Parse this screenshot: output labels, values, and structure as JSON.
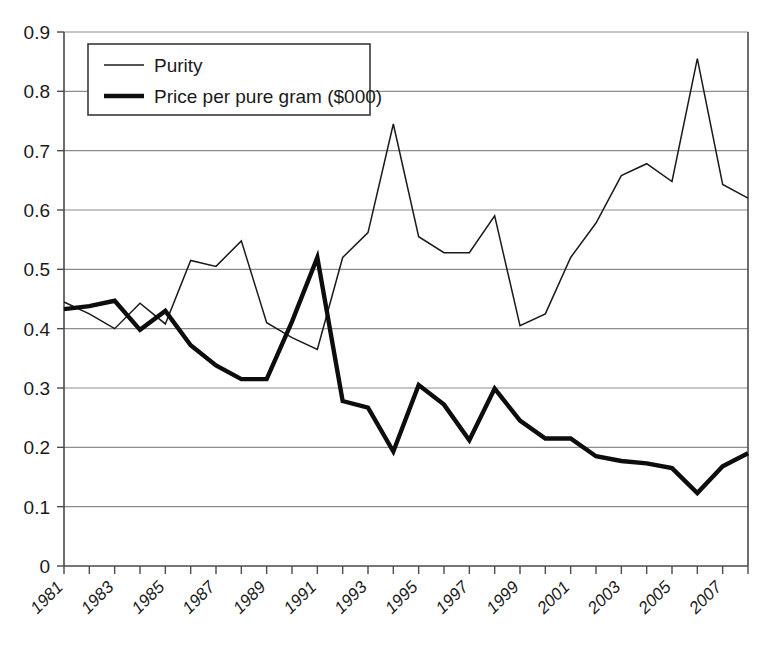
{
  "chart_data": {
    "type": "line",
    "title": "",
    "subtitle": "",
    "xlabel": "",
    "ylabel": "",
    "x": [
      1981,
      1982,
      1983,
      1984,
      1985,
      1986,
      1987,
      1988,
      1989,
      1990,
      1991,
      1992,
      1993,
      1994,
      1995,
      1996,
      1997,
      1998,
      1999,
      2000,
      2001,
      2002,
      2003,
      2004,
      2005,
      2006,
      2007,
      2008
    ],
    "xlim": [
      1981,
      2008
    ],
    "ylim": [
      0,
      0.9
    ],
    "ytick_labels": [
      "0.9",
      "0.8",
      "0.7",
      "0.6",
      "0.5",
      "0.4",
      "0.3",
      "0.2",
      "0.1",
      "0"
    ],
    "ytick_values": [
      0.9,
      0.8,
      0.7,
      0.6,
      0.5,
      0.4,
      0.3,
      0.2,
      0.1,
      0
    ],
    "xtick_labels": [
      "1981",
      "1983",
      "1985",
      "1987",
      "1989",
      "1991",
      "1993",
      "1995",
      "1997",
      "1999",
      "2001",
      "2003",
      "2005",
      "2007"
    ],
    "xtick_values": [
      1981,
      1983,
      1985,
      1987,
      1989,
      1991,
      1993,
      1995,
      1997,
      1999,
      2001,
      2003,
      2005,
      2007
    ],
    "grid": "horizontal",
    "legend_position": "top-left",
    "series": [
      {
        "name": "Purity",
        "style": "thin",
        "color": "#1a1a1a",
        "values": [
          0.445,
          0.425,
          0.4,
          0.443,
          0.408,
          0.515,
          0.505,
          0.548,
          0.41,
          0.385,
          0.365,
          0.52,
          0.562,
          0.745,
          0.555,
          0.528,
          0.528,
          0.59,
          0.405,
          0.425,
          0.52,
          0.578,
          0.658,
          0.678,
          0.648,
          0.855,
          0.643,
          0.62
        ]
      },
      {
        "name": "Price per pure gram ($000)",
        "style": "thick",
        "color": "#0d0d0d",
        "values": [
          0.433,
          0.438,
          0.447,
          0.398,
          0.43,
          0.372,
          0.338,
          0.315,
          0.315,
          0.412,
          0.52,
          0.278,
          0.267,
          0.193,
          0.305,
          0.272,
          0.212,
          0.299,
          0.245,
          0.215,
          0.215,
          0.185,
          0.177,
          0.173,
          0.165,
          0.123,
          0.168,
          0.19
        ]
      }
    ],
    "legend": [
      {
        "label": "Purity",
        "style": "thin"
      },
      {
        "label": "Price per pure gram ($000)",
        "style": "thick"
      }
    ]
  },
  "plot_geometry": {
    "left": 64,
    "right": 748,
    "top": 32,
    "bottom": 566
  }
}
